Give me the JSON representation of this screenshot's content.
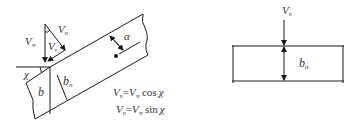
{
  "left_figure": {
    "labels": {
      "v_inf": "V",
      "v_inf_sub": "∞",
      "v_n": "V",
      "v_n_sub": "n",
      "v_t": "V",
      "v_t_sub": "τ",
      "alpha": "α",
      "chi": "χ",
      "b": "b",
      "b_n": "b",
      "b_n_sub": "n"
    },
    "formulas": [
      {
        "lhs": "V",
        "lhs_sub": "n",
        "eq": "=",
        "rhs": "V",
        "rhs_sub": "∞",
        "func": "cos",
        "arg": "χ"
      },
      {
        "lhs": "V",
        "lhs_sub": "n",
        "eq": "=",
        "rhs": "V",
        "rhs_sub": "∞",
        "func": "sin",
        "arg": "χ"
      }
    ]
  },
  "right_figure": {
    "labels": {
      "v_n": "V",
      "v_n_sub": "n",
      "b_n": "b",
      "b_n_sub": "n"
    }
  },
  "colors": {
    "line": "#1a1a1a",
    "text": "#333333",
    "background": "#ffffff"
  }
}
